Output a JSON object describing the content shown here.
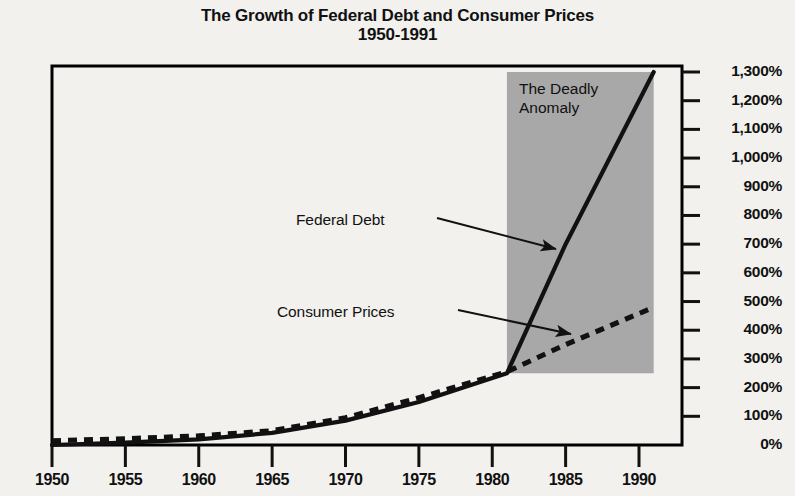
{
  "title": {
    "line1": "The Growth of Federal Debt and Consumer Prices",
    "line2": "1950-1991"
  },
  "annotations": {
    "shaded_label_line1": "The Deadly",
    "shaded_label_line2": "Anomaly",
    "federal_debt_label": "Federal Debt",
    "consumer_prices_label": "Consumer Prices"
  },
  "colors": {
    "background": "#f2f1ee",
    "ink": "#111111",
    "shaded_region": "#a8a8a8",
    "frame": "#000000"
  },
  "chart_data": {
    "type": "line",
    "title": "The Growth of Federal Debt and Consumer Prices 1950-1991",
    "subtitle": "1950-1991",
    "xlabel": "",
    "ylabel": "",
    "xlim": [
      1950,
      1991
    ],
    "ylim": [
      0,
      1300
    ],
    "grid": false,
    "legend": "annotated-inline",
    "x_ticks": [
      1950,
      1955,
      1960,
      1965,
      1970,
      1975,
      1980,
      1985,
      1990
    ],
    "x_tick_labels": [
      "1950",
      "1955",
      "1960",
      "1965",
      "1970",
      "1975",
      "1980",
      "1985",
      "1990"
    ],
    "y_ticks": [
      0,
      100,
      200,
      300,
      400,
      500,
      600,
      700,
      800,
      900,
      1000,
      1100,
      1200,
      1300
    ],
    "y_tick_labels": [
      "0%",
      "100%",
      "200%",
      "300%",
      "400%",
      "500%",
      "600%",
      "700%",
      "800%",
      "900%",
      "1,000%",
      "1,100%",
      "1,200%",
      "1,300%"
    ],
    "shaded_region": {
      "label": "The Deadly Anomaly",
      "x_start": 1981,
      "x_end": 1991,
      "y_start": 250,
      "y_end": 1300
    },
    "series": [
      {
        "name": "Federal Debt",
        "style": "solid",
        "x": [
          1950,
          1955,
          1960,
          1965,
          1970,
          1975,
          1981,
          1985,
          1991
        ],
        "values": [
          0,
          8,
          20,
          42,
          85,
          150,
          250,
          700,
          1300
        ]
      },
      {
        "name": "Consumer Prices",
        "style": "dashed",
        "x": [
          1950,
          1955,
          1960,
          1965,
          1970,
          1975,
          1981,
          1985,
          1991
        ],
        "values": [
          15,
          22,
          32,
          50,
          95,
          165,
          255,
          350,
          480
        ]
      }
    ]
  }
}
